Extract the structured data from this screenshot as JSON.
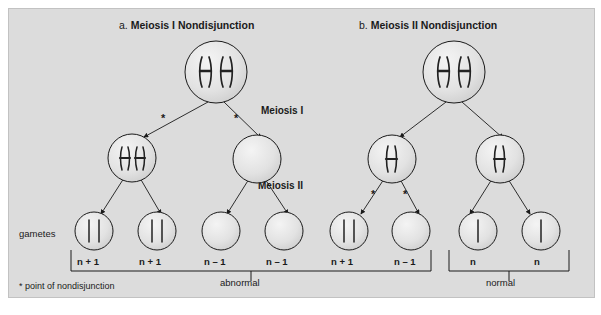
{
  "figure": {
    "background_color": "#dcdcdc",
    "ink_color": "#1a1a1a",
    "panels": [
      {
        "id": "a",
        "letter": "a.",
        "title": "Meiosis I Nondisjunction",
        "title_full": "a. Meiosis I Nondisjunction"
      },
      {
        "id": "b",
        "letter": "b.",
        "title": "Meiosis II Nondisjunction",
        "title_full": "b. Meiosis II Nondisjunction"
      }
    ],
    "stage_labels": [
      {
        "name": "meiosis-one",
        "text": "Meiosis I"
      },
      {
        "name": "meiosis-two",
        "text": "Meiosis II"
      }
    ],
    "row_label": "gametes",
    "footnote": "* point of nondisjunction",
    "asterisk_glyph": "*",
    "gametes": [
      {
        "panel": "a",
        "label": "n + 1",
        "chromatids": 2
      },
      {
        "panel": "a",
        "label": "n + 1",
        "chromatids": 2
      },
      {
        "panel": "a",
        "label": "n – 1",
        "chromatids": 0
      },
      {
        "panel": "a",
        "label": "n – 1",
        "chromatids": 0
      },
      {
        "panel": "b",
        "label": "n + 1",
        "chromatids": 2
      },
      {
        "panel": "b",
        "label": "n – 1",
        "chromatids": 0
      },
      {
        "panel": "b",
        "label": "n",
        "chromatids": 1
      },
      {
        "panel": "b",
        "label": "n",
        "chromatids": 1
      }
    ],
    "group_brackets": [
      {
        "name": "abnormal",
        "text": "abnormal",
        "covers": 6
      },
      {
        "name": "normal",
        "text": "normal",
        "covers": 2
      }
    ],
    "cells": {
      "parent_a": {
        "chromosomes": 2,
        "shape": "duplicated-x"
      },
      "parent_b": {
        "chromosomes": 2,
        "shape": "duplicated-x"
      },
      "meiosis1_a_left": {
        "chromosomes": 2,
        "shape": "duplicated-x"
      },
      "meiosis1_a_right": {
        "chromosomes": 0,
        "shape": "empty"
      },
      "meiosis1_b_left": {
        "chromosomes": 1,
        "shape": "duplicated-x"
      },
      "meiosis1_b_right": {
        "chromosomes": 1,
        "shape": "duplicated-x"
      }
    },
    "nondisjunction_marks": {
      "panel_a_stage": "Meiosis I",
      "panel_a_count": 2,
      "panel_b_stage": "Meiosis II",
      "panel_b_count": 2
    }
  }
}
